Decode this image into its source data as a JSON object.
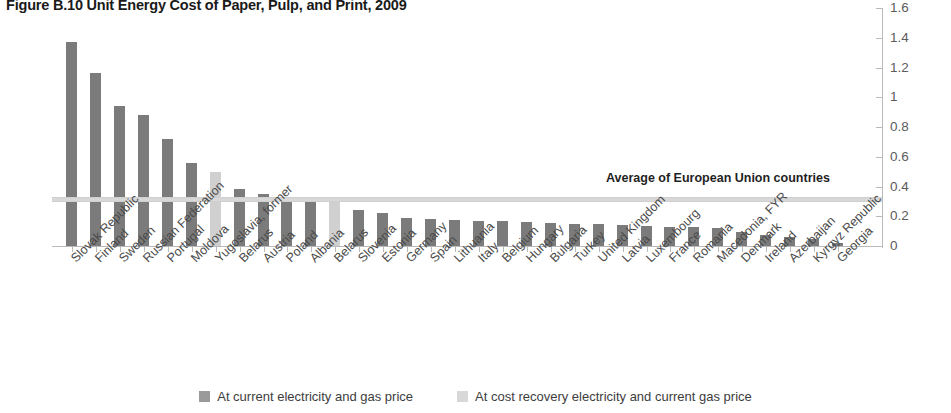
{
  "figure": {
    "title": "Figure B.10  Unit Energy Cost of Paper, Pulp, and Print, 2009"
  },
  "legend": {
    "items": [
      {
        "label": "At current electricity and gas price",
        "color": "#9a9a9a",
        "key": "current"
      },
      {
        "label": "At cost recovery electricity and current gas price",
        "color": "#d8d8d8",
        "key": "cost_recovery"
      }
    ]
  },
  "annotations": {
    "average_line": {
      "label": "Average of European Union countries",
      "value": 0.33,
      "color": "#d8d8d8"
    }
  },
  "chart_data": {
    "type": "bar",
    "title": "Figure B.10  Unit Energy Cost of Paper, Pulp, and Print, 2009",
    "xlabel": "",
    "ylabel": "Energy cost/value added (constant $",
    "ylim": [
      0,
      1.6
    ],
    "yticks": [
      "0",
      "0.2",
      "0.4",
      "0.6",
      "0.8",
      "1",
      "1.2",
      "1.4",
      "1.6"
    ],
    "ytick_values": [
      0,
      0.2,
      0.4,
      0.6,
      0.8,
      1.0,
      1.2,
      1.4,
      1.6
    ],
    "grid": false,
    "legend_position": "bottom-center",
    "series_colors": {
      "current": "#7b7b7b",
      "cost_recovery": "#d0d0d0"
    },
    "categories": [
      "Slovak Republic",
      "Finland",
      "Sweden",
      "Russian Federation",
      "Portugal",
      "Moldova",
      "Yugoslavia, former",
      "Belarus",
      "Austria",
      "Poland",
      "Albania",
      "Belarus",
      "Slovenia",
      "Estonia",
      "Germany",
      "Spain",
      "Lithuania",
      "Italy",
      "Belgium",
      "Hungary",
      "Bulgaria",
      "Turkey",
      "United Kingdom",
      "Latvia",
      "Luxembourg",
      "France",
      "Romania",
      "Macedonia, FYR",
      "Denmark",
      "Ireland",
      "Azerbaijan",
      "Kyrgyz Republic",
      "Georgia"
    ],
    "values": [
      1.37,
      1.16,
      0.94,
      0.88,
      0.72,
      0.56,
      0.5,
      0.38,
      0.35,
      0.33,
      0.31,
      0.3,
      0.24,
      0.22,
      0.19,
      0.18,
      0.175,
      0.17,
      0.165,
      0.16,
      0.155,
      0.15,
      0.145,
      0.14,
      0.135,
      0.13,
      0.125,
      0.12,
      0.095,
      0.075,
      0.06,
      0.045,
      0.02
    ],
    "bar_series": [
      "current",
      "current",
      "current",
      "current",
      "current",
      "current",
      "cost_recovery",
      "current",
      "current",
      "current",
      "current",
      "cost_recovery",
      "current",
      "current",
      "current",
      "current",
      "current",
      "current",
      "current",
      "current",
      "current",
      "current",
      "current",
      "current",
      "current",
      "current",
      "current",
      "current",
      "current",
      "current",
      "current",
      "current",
      "current"
    ],
    "annotations": [
      {
        "type": "hline",
        "label": "Average of European Union countries",
        "value": 0.33
      }
    ]
  },
  "axis": {
    "y_title": "Energy cost/value added (constant $"
  }
}
